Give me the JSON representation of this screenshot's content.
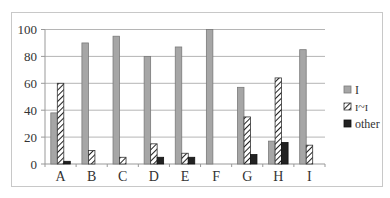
{
  "chart_data": {
    "type": "bar",
    "title": "",
    "xlabel": "",
    "ylabel": "",
    "ylim": [
      0,
      100
    ],
    "yticks": [
      0,
      20,
      40,
      60,
      80,
      100
    ],
    "grid": true,
    "legend_position": "right",
    "categories": [
      "A",
      "B",
      "C",
      "D",
      "E",
      "F",
      "G",
      "H",
      "I"
    ],
    "series": [
      {
        "name": "I",
        "style": "solid-gray",
        "color": "#a6a6a6",
        "values": [
          38,
          90,
          95,
          80,
          87,
          100,
          57,
          17,
          85
        ]
      },
      {
        "name": "ɪ~ɪ",
        "style": "hatched",
        "color": "#ffffff",
        "values": [
          60,
          10,
          5,
          15,
          8,
          0,
          35,
          64,
          14
        ]
      },
      {
        "name": "other",
        "style": "solid-black",
        "color": "#222222",
        "values": [
          2,
          0,
          0,
          5,
          5,
          0,
          7,
          16,
          0
        ]
      }
    ]
  }
}
